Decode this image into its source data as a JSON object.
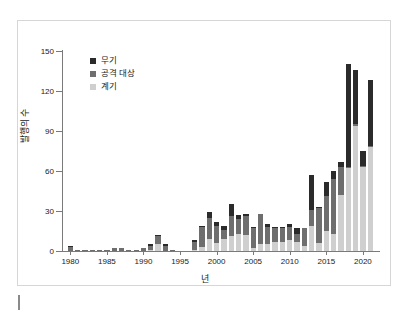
{
  "figure": {
    "y_axis_title": "발행의 수",
    "x_axis_title": "년"
  },
  "legend": {
    "items": [
      {
        "label": "무기",
        "color": "#2b2b2b",
        "key": "weapon"
      },
      {
        "label": "공격 대상",
        "color": "#6e6e6e",
        "key": "target"
      },
      {
        "label": "계기",
        "color": "#cfcfcf",
        "key": "trigger"
      }
    ]
  },
  "chart_data": {
    "type": "bar",
    "stacked": true,
    "title": "",
    "subtitle": "",
    "xlabel": "년",
    "ylabel": "발행의 수",
    "xlim": [
      1979,
      2022
    ],
    "ylim": [
      0,
      150
    ],
    "yticks": [
      0,
      30,
      60,
      90,
      120,
      150
    ],
    "xticks": [
      1980,
      1985,
      1990,
      1995,
      2000,
      2005,
      2010,
      2015,
      2020
    ],
    "grid": false,
    "legend_position": "upper-left-inside",
    "categories": [
      1980,
      1981,
      1982,
      1983,
      1984,
      1985,
      1986,
      1987,
      1988,
      1989,
      1990,
      1991,
      1992,
      1993,
      1994,
      1995,
      1996,
      1997,
      1998,
      1999,
      2000,
      2001,
      2002,
      2003,
      2004,
      2005,
      2006,
      2007,
      2008,
      2009,
      2010,
      2011,
      2012,
      2013,
      2014,
      2015,
      2016,
      2017,
      2018,
      2019,
      2020,
      2021
    ],
    "series": [
      {
        "name": "계기",
        "color": "#cfcfcf",
        "values": [
          0,
          0,
          0,
          0,
          0,
          0,
          0,
          0,
          0,
          0,
          0,
          1,
          5,
          0,
          0,
          0,
          0,
          1,
          3,
          9,
          6,
          9,
          11,
          13,
          12,
          2,
          5,
          5,
          7,
          7,
          8,
          7,
          4,
          19,
          6,
          15,
          13,
          42,
          62,
          94,
          63,
          78
        ]
      },
      {
        "name": "공격 대상",
        "color": "#6e6e6e",
        "values": [
          3,
          1,
          1,
          1,
          1,
          1,
          2,
          2,
          1,
          1,
          2,
          3,
          6,
          4,
          1,
          0,
          0,
          6,
          15,
          16,
          13,
          7,
          15,
          11,
          14,
          15,
          23,
          13,
          10,
          10,
          10,
          6,
          13,
          12,
          26,
          26,
          41,
          21,
          1,
          1,
          1,
          1
        ]
      },
      {
        "name": "무기",
        "color": "#2b2b2b",
        "values": [
          1,
          0,
          0,
          0,
          0,
          0,
          0,
          0,
          0,
          0,
          0,
          1,
          1,
          1,
          0,
          0,
          0,
          1,
          1,
          4,
          3,
          3,
          9,
          3,
          2,
          1,
          0,
          2,
          1,
          1,
          2,
          4,
          0,
          26,
          1,
          11,
          6,
          4,
          77,
          41,
          11,
          49
        ]
      }
    ],
    "totals": [
      4,
      1,
      1,
      1,
      1,
      1,
      2,
      2,
      1,
      1,
      2,
      5,
      12,
      5,
      1,
      0,
      0,
      8,
      19,
      29,
      22,
      19,
      35,
      27,
      28,
      18,
      28,
      20,
      18,
      18,
      20,
      17,
      17,
      57,
      33,
      52,
      60,
      67,
      140,
      136,
      75,
      128
    ]
  }
}
